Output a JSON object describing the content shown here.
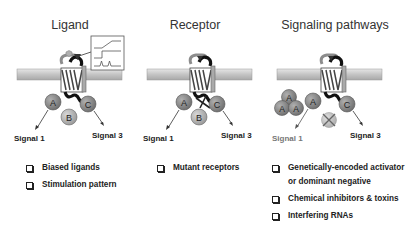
{
  "panels": [
    {
      "title": "Ligand",
      "signals": [
        "Signal 1",
        "Signal 3"
      ],
      "effectors": [
        "A",
        "B",
        "C"
      ],
      "inset": "stimulation-pattern-graphs",
      "items": [
        "Biased ligands",
        "Stimulation pattern"
      ]
    },
    {
      "title": "Receptor",
      "signals": [
        "Signal 1",
        "Signal 3"
      ],
      "effectors": [
        "A",
        "B",
        "C"
      ],
      "items": [
        "Mutant receptors"
      ]
    },
    {
      "title": "Signaling pathways",
      "signals": [
        "Signal 1",
        "Signal 3"
      ],
      "effectors": [
        "A",
        "A",
        "A",
        "A",
        "B",
        "C"
      ],
      "items": [
        "Genetically-encoded activator",
        "or dominant negative",
        "Chemical inhibitors & toxins",
        "Interfering RNAs"
      ]
    }
  ],
  "colors": {
    "membrane": "#c8c8c8",
    "effector_A": "#8a8a8a",
    "effector_B": "#b5b5b5",
    "effector_C": "#9a9a9a",
    "text": "#222222",
    "signal_faded": "#777777"
  }
}
